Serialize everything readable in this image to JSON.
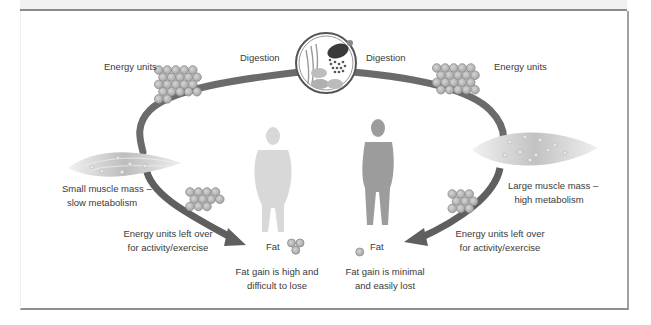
{
  "diagram": {
    "colors": {
      "arc": "#6b6b6b",
      "arrow": "#5f5f5f",
      "unit_fill": "#b3b3b3",
      "unit_stroke": "#8d8d8d",
      "frame": "#8f8f8f",
      "text": "#3a3a3a",
      "figure_light": "#d9d9d9",
      "figure_dark": "#9a9a9a",
      "muscle": "#d2d2d2"
    },
    "digestion_icon": "digestion-circle-icon",
    "labels": {
      "digestion_left": "Digestion",
      "digestion_right": "Digestion",
      "energy_units_left": "Energy units",
      "energy_units_right": "Energy units",
      "small_muscle": [
        "Small muscle mass –",
        "slow metabolism"
      ],
      "large_muscle": [
        "Large muscle mass –",
        "high metabolism"
      ],
      "leftover_left": [
        "Energy units left over",
        "for activity/exercise"
      ],
      "leftover_right": [
        "Energy units left over",
        "for activity/exercise"
      ],
      "fat_left": "Fat",
      "fat_right": "Fat",
      "fat_gain_left": [
        "Fat gain is high and",
        "difficult to lose"
      ],
      "fat_gain_right": [
        "Fat gain is minimal",
        "and easily lost"
      ]
    },
    "counts": {
      "energy_units_top_left": 22,
      "energy_units_top_right": 20,
      "leftover_units_left": 11,
      "leftover_units_right": 9,
      "fat_units_left": 3,
      "fat_units_right": 1
    }
  }
}
